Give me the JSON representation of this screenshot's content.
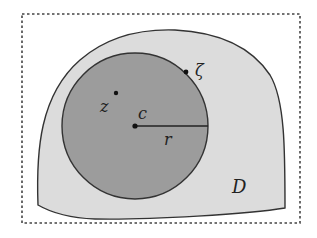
{
  "figure": {
    "colors": {
      "background": "#ffffff",
      "frame": "#444444",
      "region_fill": "#dcdcdc",
      "disk_fill": "#9c9c9c",
      "stroke": "#333333",
      "text": "#222222"
    },
    "frame": {
      "style": "dotted",
      "x": 22,
      "y": 14,
      "width": 278,
      "height": 209
    },
    "region": {
      "label": "D"
    },
    "disk": {
      "center_label": "c",
      "radius_label": "r",
      "cx": 135,
      "cy": 126,
      "r": 73
    },
    "points": [
      {
        "label": "z",
        "x": 116,
        "y": 93,
        "location": "interior of disk"
      },
      {
        "label": "ζ",
        "x": 187,
        "y": 73,
        "location": "on disk boundary"
      },
      {
        "label": "c",
        "x": 135,
        "y": 126,
        "location": "center of disk"
      }
    ],
    "labels": {
      "D": "D",
      "z": "z",
      "zeta": "ζ",
      "c": "c",
      "r": "r"
    }
  }
}
